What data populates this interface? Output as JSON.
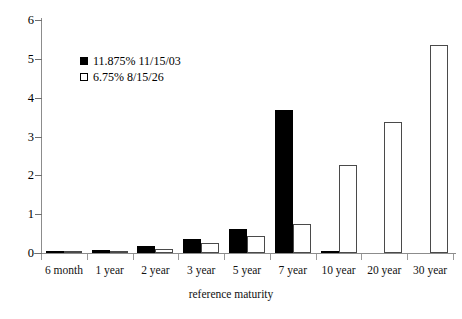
{
  "chart_data": {
    "type": "bar",
    "title": "",
    "xlabel": "reference maturity",
    "ylabel": "",
    "ylim": [
      0,
      6
    ],
    "yticks": [
      0,
      1,
      2,
      3,
      4,
      5,
      6
    ],
    "grid": false,
    "legend_position": "upper-left-inside",
    "categories": [
      "6 month",
      "1 year",
      "2 year",
      "3 year",
      "5 year",
      "7 year",
      "10 year",
      "20 year",
      "30 year"
    ],
    "series": [
      {
        "name": "11.875% 11/15/03",
        "style": "filled",
        "color": "#000000",
        "values": [
          0.03,
          0.08,
          0.17,
          0.35,
          0.63,
          3.68,
          0.06,
          0.0,
          0.0
        ]
      },
      {
        "name": "6.75% 8/15/26",
        "style": "hollow",
        "color": "#ffffff",
        "values": [
          0.02,
          0.04,
          0.1,
          0.25,
          0.45,
          0.75,
          2.27,
          3.38,
          5.36
        ]
      }
    ]
  },
  "axis": {
    "y_tick_labels": [
      "0",
      "1",
      "2",
      "3",
      "4",
      "5",
      "6"
    ],
    "x_axis_title": "reference maturity"
  }
}
